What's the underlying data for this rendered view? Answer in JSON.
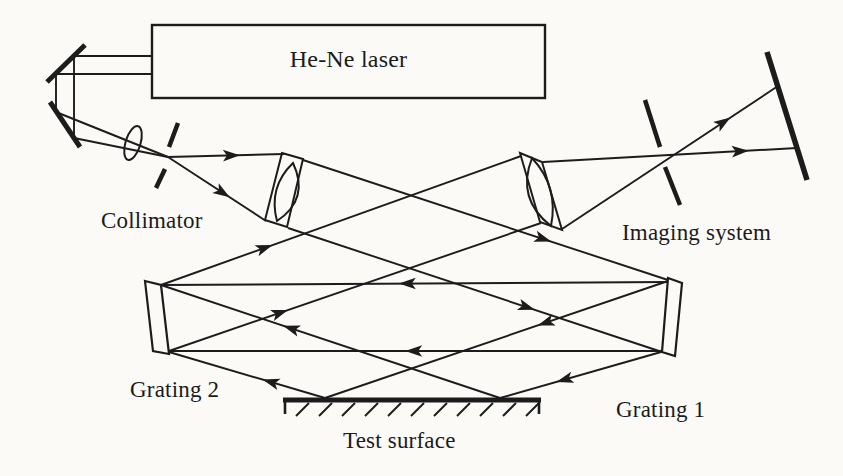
{
  "diagram": {
    "type": "optical-setup-schematic",
    "colors": {
      "ink": "#1c1c1c",
      "paper": "#fbfaf7",
      "component_fill": "#fbfaf7"
    },
    "canvas": {
      "width": 843,
      "height": 476
    },
    "arrowhead": {
      "path": "M0,0 L-17,-5.8 L-13,0 L-17,5.8 Z"
    },
    "labels": {
      "laser": {
        "text": "He-Ne laser",
        "x": 152,
        "y": 47,
        "w": 393,
        "align": "center",
        "size": 24
      },
      "collimator": {
        "text": "Collimator",
        "x": 101,
        "y": 209,
        "size": 23
      },
      "imaging": {
        "text": "Imaging system",
        "x": 622,
        "y": 221,
        "size": 23
      },
      "grating2": {
        "text": "Grating 2",
        "x": 130,
        "y": 378,
        "size": 23
      },
      "grating1": {
        "text": "Grating 1",
        "x": 616,
        "y": 398,
        "size": 23
      },
      "test_surface": {
        "text": "Test surface",
        "x": 343,
        "y": 429,
        "size": 23
      }
    },
    "components": [
      {
        "name": "laser-box",
        "kind": "rect",
        "x": 152,
        "y": 25,
        "w": 393,
        "h": 73,
        "sw": 2.4
      },
      {
        "name": "fold-mirror-1",
        "kind": "line",
        "x1": 47,
        "y1": 82,
        "x2": 85,
        "y2": 45,
        "sw": 5
      },
      {
        "name": "fold-mirror-2",
        "kind": "line",
        "x1": 50,
        "y1": 102,
        "x2": 80,
        "y2": 147,
        "sw": 5
      },
      {
        "name": "focusing-lens",
        "kind": "ellipse",
        "cx": 133,
        "cy": 143,
        "rx": 7.5,
        "ry": 17.5,
        "rot": 17,
        "sw": 2
      },
      {
        "name": "pinhole-aperture-top",
        "kind": "line",
        "x1": 178,
        "y1": 123,
        "x2": 169,
        "y2": 147,
        "sw": 4.5
      },
      {
        "name": "pinhole-aperture-bottom",
        "kind": "line",
        "x1": 165,
        "y1": 169,
        "x2": 156,
        "y2": 188,
        "sw": 4.5
      },
      {
        "name": "collimating-lens-mount",
        "kind": "poly",
        "pts": "282,153 303,159 287,227 265,220",
        "sw": 2
      },
      {
        "name": "collimating-lens",
        "kind": "path",
        "d": "M293,163 Q310,199 277,221 Q268,187 293,163 Z",
        "sw": 2
      },
      {
        "name": "imaging-lens-mount",
        "kind": "poly",
        "pts": "520,153 542,162 562,230 540,222",
        "sw": 2
      },
      {
        "name": "imaging-lens",
        "kind": "path",
        "d": "M532,158 Q516,199 551,226 Q559,187 532,158 Z",
        "sw": 2
      },
      {
        "name": "imaging-aperture-top",
        "kind": "line",
        "x1": 645,
        "y1": 100,
        "x2": 660,
        "y2": 147,
        "sw": 4.5
      },
      {
        "name": "imaging-aperture-bottom",
        "kind": "line",
        "x1": 665,
        "y1": 167,
        "x2": 680,
        "y2": 205,
        "sw": 4.5
      },
      {
        "name": "image-plane-screen",
        "kind": "line",
        "x1": 767,
        "y1": 52,
        "x2": 807,
        "y2": 180,
        "sw": 5.5
      },
      {
        "name": "grating-2",
        "kind": "poly",
        "pts": "145,281 161,285 169,354 153,351",
        "sw": 2.2,
        "fill": true
      },
      {
        "name": "grating-1",
        "kind": "poly",
        "pts": "668,278 682,283 675,356 662,352",
        "sw": 2.2,
        "fill": true
      },
      {
        "name": "test-surface-face",
        "kind": "line",
        "x1": 283,
        "y1": 400,
        "x2": 541,
        "y2": 400,
        "sw": 5
      },
      {
        "name": "test-surface-end-left",
        "kind": "line",
        "x1": 285,
        "y1": 400,
        "x2": 285,
        "y2": 414,
        "sw": 2.6
      },
      {
        "name": "test-surface-end-right",
        "kind": "line",
        "x1": 539,
        "y1": 400,
        "x2": 539,
        "y2": 414,
        "sw": 2.6
      },
      {
        "name": "test-surface-hatching",
        "kind": "hatch",
        "x_start": 296,
        "step": 23,
        "count": 11,
        "y_bot": 416,
        "y_top": 403,
        "slant": 13,
        "sw": 2
      }
    ],
    "rays": [
      {
        "name": "laser-beam-upper",
        "x1": 152,
        "y1": 56,
        "x2": 74,
        "y2": 56,
        "arrows": []
      },
      {
        "name": "laser-beam-lower",
        "x1": 152,
        "y1": 74,
        "x2": 56,
        "y2": 74,
        "arrows": []
      },
      {
        "name": "folded-beam-right",
        "x1": 74,
        "y1": 56,
        "x2": 74,
        "y2": 138,
        "arrows": []
      },
      {
        "name": "folded-beam-left",
        "x1": 56,
        "y1": 74,
        "x2": 56,
        "y2": 112,
        "arrows": []
      },
      {
        "name": "mirror2-to-pinhole-upper",
        "x1": 56,
        "y1": 112,
        "x2": 168,
        "y2": 157,
        "arrows": []
      },
      {
        "name": "mirror2-to-pinhole-lower",
        "x1": 74,
        "y1": 138,
        "x2": 168,
        "y2": 157,
        "arrows": []
      },
      {
        "name": "pinhole-to-lens-upper",
        "x1": 168,
        "y1": 157,
        "x2": 284,
        "y2": 154,
        "arrows": [
          0.62
        ]
      },
      {
        "name": "pinhole-to-lens-lower",
        "x1": 168,
        "y1": 157,
        "x2": 266,
        "y2": 221,
        "arrows": [
          0.63
        ]
      },
      {
        "name": "collimated-to-grating1-top",
        "x1": 303,
        "y1": 160,
        "x2": 668,
        "y2": 280,
        "arrows": [
          0.68
        ]
      },
      {
        "name": "collimated-to-grating1-bot",
        "x1": 288,
        "y1": 228,
        "x2": 662,
        "y2": 352,
        "arrows": [
          0.66
        ]
      },
      {
        "name": "grating1-to-grating2-top",
        "x1": 667,
        "y1": 282,
        "x2": 161,
        "y2": 285,
        "arrows": [
          0.53
        ]
      },
      {
        "name": "grating1-to-grating2-bot",
        "x1": 661,
        "y1": 351,
        "x2": 169,
        "y2": 351,
        "arrows": [
          0.52
        ]
      },
      {
        "name": "grating1-to-test-surface",
        "x1": 668,
        "y1": 281,
        "x2": 325,
        "y2": 398,
        "arrows": [
          0.38
        ]
      },
      {
        "name": "grating1-to-test-surface-2",
        "x1": 661,
        "y1": 352,
        "x2": 500,
        "y2": 398,
        "arrows": [
          0.65
        ]
      },
      {
        "name": "test-surface-to-grating2",
        "x1": 500,
        "y1": 398,
        "x2": 161,
        "y2": 285,
        "arrows": [
          0.64
        ]
      },
      {
        "name": "test-surface-to-grating2-2",
        "x1": 325,
        "y1": 398,
        "x2": 169,
        "y2": 352,
        "arrows": [
          0.4
        ]
      },
      {
        "name": "grating2-to-imaging-lens-top",
        "x1": 161,
        "y1": 285,
        "x2": 521,
        "y2": 156,
        "arrows": [
          0.31
        ]
      },
      {
        "name": "grating2-to-imaging-lens-bot",
        "x1": 169,
        "y1": 351,
        "x2": 541,
        "y2": 223,
        "arrows": [
          0.32
        ]
      },
      {
        "name": "imaging-lens-to-screen-flat",
        "x1": 543,
        "y1": 162,
        "x2": 797,
        "y2": 148,
        "arrows": [
          0.81
        ]
      },
      {
        "name": "imaging-lens-to-screen-steep",
        "x1": 562,
        "y1": 229,
        "x2": 778,
        "y2": 86,
        "arrows": [
          0.78
        ]
      }
    ]
  }
}
